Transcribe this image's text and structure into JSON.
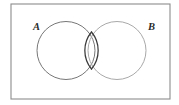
{
  "figure": {
    "name": "venn-diagram-two-sets",
    "type": "venn",
    "background_color": "#ffffff"
  },
  "universe_box": {
    "name": "universal-set-rectangle",
    "x": 11,
    "y": 4,
    "width": 159,
    "height": 95,
    "stroke_color": "#8c8c8c",
    "stroke_width": 1.1,
    "fill": "none"
  },
  "sets": [
    {
      "id": "A",
      "label": "A",
      "label_x": 33,
      "label_y": 30,
      "center_x": 66,
      "center_y": 50.5,
      "radius": 29,
      "stroke_color": "#777777",
      "stroke_width": 1.0
    },
    {
      "id": "B",
      "label": "B",
      "label_x": 148,
      "label_y": 30,
      "center_x": 117,
      "center_y": 50.5,
      "radius": 29,
      "stroke_color": "#a9a9a9",
      "stroke_width": 1.0
    }
  ],
  "intersection": {
    "name": "intersection-lens",
    "stroke_color": "#3a3a3a",
    "stroke_width": 1.25,
    "top_point": {
      "x": 91.5,
      "y": 32.0
    },
    "bottom_point": {
      "x": 91.5,
      "y": 69.0
    },
    "fill": "none"
  },
  "colors": {
    "border": "#8c8c8c",
    "circle_a": "#777777",
    "circle_b": "#a9a9a9",
    "lens": "#3a3a3a",
    "label_text": "#2b2b2b",
    "background": "#ffffff"
  }
}
